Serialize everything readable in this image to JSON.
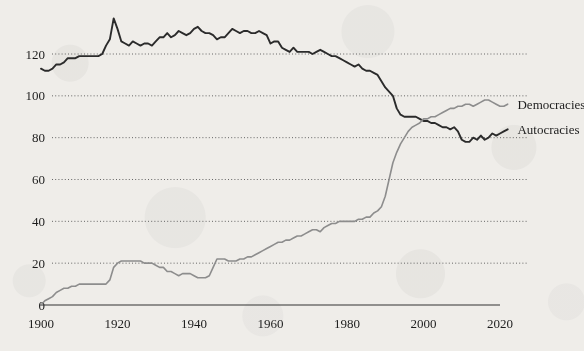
{
  "chart_data": {
    "type": "line",
    "title": "",
    "subtitle": "",
    "xlabel": "",
    "ylabel": "",
    "xlim": [
      1900,
      2022
    ],
    "ylim": [
      0,
      140
    ],
    "yticks": [
      0,
      20,
      40,
      60,
      80,
      100,
      120
    ],
    "ytick_labels": [
      "0",
      "20",
      "40",
      "60",
      "80",
      "100",
      "120"
    ],
    "xticks": [
      1900,
      1920,
      1940,
      1960,
      1980,
      2000,
      2020
    ],
    "xtick_labels": [
      "1900",
      "1920",
      "1940",
      "1960",
      "1980",
      "2000",
      "2020"
    ],
    "grid": "horizontal-dotted",
    "legend_position": "right-inline-end-of-line",
    "series": [
      {
        "name": "Autocracies",
        "label": "Autocracies",
        "color": "#2b2b2b",
        "label_x": 2023,
        "label_y": 84,
        "x": [
          1900,
          1901,
          1902,
          1903,
          1904,
          1905,
          1906,
          1907,
          1908,
          1909,
          1910,
          1911,
          1912,
          1913,
          1914,
          1915,
          1916,
          1917,
          1918,
          1919,
          1920,
          1921,
          1922,
          1923,
          1924,
          1925,
          1926,
          1927,
          1928,
          1929,
          1930,
          1931,
          1932,
          1933,
          1934,
          1935,
          1936,
          1937,
          1938,
          1939,
          1940,
          1941,
          1942,
          1943,
          1944,
          1945,
          1946,
          1947,
          1948,
          1949,
          1950,
          1951,
          1952,
          1953,
          1954,
          1955,
          1956,
          1957,
          1958,
          1959,
          1960,
          1961,
          1962,
          1963,
          1964,
          1965,
          1966,
          1967,
          1968,
          1969,
          1970,
          1971,
          1972,
          1973,
          1974,
          1975,
          1976,
          1977,
          1978,
          1979,
          1980,
          1981,
          1982,
          1983,
          1984,
          1985,
          1986,
          1987,
          1988,
          1989,
          1990,
          1991,
          1992,
          1993,
          1994,
          1995,
          1996,
          1997,
          1998,
          1999,
          2000,
          2001,
          2002,
          2003,
          2004,
          2005,
          2006,
          2007,
          2008,
          2009,
          2010,
          2011,
          2012,
          2013,
          2014,
          2015,
          2016,
          2017,
          2018,
          2019,
          2020,
          2021,
          2022
        ],
        "values": [
          113,
          112,
          112,
          113,
          115,
          115,
          116,
          118,
          118,
          118,
          119,
          119,
          119,
          119,
          119,
          119,
          120,
          124,
          127,
          137,
          132,
          126,
          125,
          124,
          126,
          125,
          124,
          125,
          125,
          124,
          126,
          128,
          128,
          130,
          128,
          129,
          131,
          130,
          129,
          130,
          132,
          133,
          131,
          130,
          130,
          129,
          127,
          128,
          128,
          130,
          132,
          131,
          130,
          131,
          131,
          130,
          130,
          131,
          130,
          129,
          125,
          126,
          126,
          123,
          122,
          121,
          123,
          121,
          121,
          121,
          121,
          120,
          121,
          122,
          121,
          120,
          119,
          119,
          118,
          117,
          116,
          115,
          114,
          115,
          113,
          112,
          112,
          111,
          110,
          107,
          104,
          102,
          100,
          94,
          91,
          90,
          90,
          90,
          90,
          89,
          88,
          88,
          87,
          87,
          86,
          85,
          85,
          84,
          85,
          83,
          79,
          78,
          78,
          80,
          79,
          81,
          79,
          80,
          82,
          81,
          82,
          83,
          84
        ]
      },
      {
        "name": "Democracies",
        "label": "Democracies",
        "color": "#8d8d8d",
        "label_x": 2023,
        "label_y": 96,
        "x": [
          1900,
          1901,
          1902,
          1903,
          1904,
          1905,
          1906,
          1907,
          1908,
          1909,
          1910,
          1911,
          1912,
          1913,
          1914,
          1915,
          1916,
          1917,
          1918,
          1919,
          1920,
          1921,
          1922,
          1923,
          1924,
          1925,
          1926,
          1927,
          1928,
          1929,
          1930,
          1931,
          1932,
          1933,
          1934,
          1935,
          1936,
          1937,
          1938,
          1939,
          1940,
          1941,
          1942,
          1943,
          1944,
          1945,
          1946,
          1947,
          1948,
          1949,
          1950,
          1951,
          1952,
          1953,
          1954,
          1955,
          1956,
          1957,
          1958,
          1959,
          1960,
          1961,
          1962,
          1963,
          1964,
          1965,
          1966,
          1967,
          1968,
          1969,
          1970,
          1971,
          1972,
          1973,
          1974,
          1975,
          1976,
          1977,
          1978,
          1979,
          1980,
          1981,
          1982,
          1983,
          1984,
          1985,
          1986,
          1987,
          1988,
          1989,
          1990,
          1991,
          1992,
          1993,
          1994,
          1995,
          1996,
          1997,
          1998,
          1999,
          2000,
          2001,
          2002,
          2003,
          2004,
          2005,
          2006,
          2007,
          2008,
          2009,
          2010,
          2011,
          2012,
          2013,
          2014,
          2015,
          2016,
          2017,
          2018,
          2019,
          2020,
          2021,
          2022
        ],
        "values": [
          0,
          2,
          3,
          4,
          6,
          7,
          8,
          8,
          9,
          9,
          10,
          10,
          10,
          10,
          10,
          10,
          10,
          10,
          12,
          18,
          20,
          21,
          21,
          21,
          21,
          21,
          21,
          20,
          20,
          20,
          19,
          18,
          18,
          16,
          16,
          15,
          14,
          15,
          15,
          15,
          14,
          13,
          13,
          13,
          14,
          18,
          22,
          22,
          22,
          21,
          21,
          21,
          22,
          22,
          23,
          23,
          24,
          25,
          26,
          27,
          28,
          29,
          30,
          30,
          31,
          31,
          32,
          33,
          33,
          34,
          35,
          36,
          36,
          35,
          37,
          38,
          39,
          39,
          40,
          40,
          40,
          40,
          40,
          41,
          41,
          42,
          42,
          44,
          45,
          47,
          52,
          60,
          68,
          73,
          77,
          80,
          83,
          85,
          86,
          87,
          89,
          89,
          90,
          90,
          91,
          92,
          93,
          94,
          94,
          95,
          95,
          96,
          96,
          95,
          96,
          97,
          98,
          98,
          97,
          96,
          95,
          95,
          96
        ]
      }
    ]
  },
  "axis": {
    "x_axis_name": "x-axis-line",
    "y_axis_name": "y-axis-ticks"
  }
}
